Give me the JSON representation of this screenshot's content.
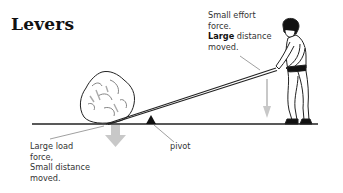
{
  "title": "Levers",
  "labels": {
    "effort": {
      "line1": "Small effort",
      "line2": "force.",
      "line3_bold": "Large",
      "line3_rest": " distance",
      "line4": "moved."
    },
    "load": {
      "line1": "Large load",
      "line2": "force,",
      "line3": "Small distance",
      "line4": "moved."
    },
    "pivot": "pivot"
  },
  "colors": {
    "arrow": "#c8c8c8",
    "line": "#222222",
    "text": "#333333"
  }
}
